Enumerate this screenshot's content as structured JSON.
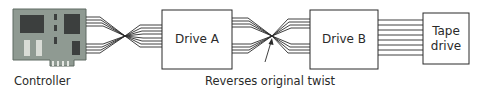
{
  "diagram": {
    "type": "SCSI/cable twist chain",
    "nodes": [
      {
        "id": "controller",
        "label": "Controller",
        "kind": "circuit-board"
      },
      {
        "id": "drive_a",
        "label": "Drive A",
        "kind": "box"
      },
      {
        "id": "drive_b",
        "label": "Drive B",
        "kind": "box"
      },
      {
        "id": "tape_drive",
        "label_line1": "Tape",
        "label_line2": "drive",
        "kind": "box"
      }
    ],
    "connections": [
      {
        "from": "controller",
        "to": "drive_a",
        "style": "twisted"
      },
      {
        "from": "drive_a",
        "to": "drive_b",
        "style": "twisted"
      },
      {
        "from": "drive_b",
        "to": "tape_drive",
        "style": "straight"
      }
    ],
    "annotation": {
      "text": "Reverses original twist",
      "points_to": "twist between Drive A and Drive B"
    },
    "colors": {
      "board": "#8f9a92",
      "board_edge": "#5f6a63",
      "chip": "#3c3f3e",
      "slot": "#d9dcd6",
      "line": "#2a2a2a"
    }
  }
}
